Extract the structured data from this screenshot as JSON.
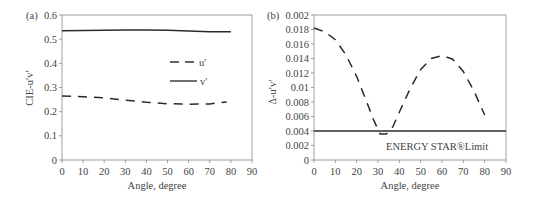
{
  "chart_data": [
    {
      "panel": "(a)",
      "type": "line",
      "title": "",
      "xlabel": "Angle, degree",
      "ylabel": "CIE-u′v′",
      "xlim": [
        0,
        90
      ],
      "ylim": [
        0,
        0.6
      ],
      "x_ticks": [
        "0",
        "10",
        "20",
        "30",
        "40",
        "50",
        "60",
        "70",
        "80",
        "90"
      ],
      "y_ticks": [
        "0",
        "0.1",
        "0.2",
        "0.3",
        "0.4",
        "0.5",
        "0.6"
      ],
      "grid": false,
      "legend_position": "inside-right",
      "series": [
        {
          "name": "u′",
          "style": "dashed",
          "x": [
            0,
            10,
            20,
            30,
            40,
            50,
            60,
            70,
            78
          ],
          "values": [
            0.265,
            0.262,
            0.257,
            0.248,
            0.239,
            0.233,
            0.231,
            0.232,
            0.24
          ]
        },
        {
          "name": "v′",
          "style": "solid",
          "x": [
            0,
            10,
            20,
            30,
            40,
            50,
            60,
            70,
            80
          ],
          "values": [
            0.535,
            0.536,
            0.537,
            0.538,
            0.538,
            0.537,
            0.534,
            0.531,
            0.531
          ]
        }
      ]
    },
    {
      "panel": "(b)",
      "type": "line",
      "title": "",
      "xlabel": "Angle, degree",
      "ylabel": "Δ-u′v′",
      "xlim": [
        0,
        90
      ],
      "ylim": [
        0,
        0.02
      ],
      "x_ticks": [
        "0",
        "10",
        "20",
        "30",
        "40",
        "50",
        "60",
        "70",
        "80",
        "90"
      ],
      "y_ticks": [
        "0",
        "0.002",
        "0.004",
        "0.006",
        "0.008",
        "0.01",
        "0.012",
        "0.014",
        "0.016",
        "0.018",
        "0.002"
      ],
      "grid": false,
      "annotations": [
        "ENERGY STAR®Limit"
      ],
      "series": [
        {
          "name": "Δu′v′",
          "style": "dashed",
          "x": [
            0,
            5,
            10,
            15,
            20,
            25,
            28,
            31,
            34,
            37,
            40,
            45,
            50,
            55,
            60,
            65,
            70,
            75,
            80
          ],
          "values": [
            0.0182,
            0.0177,
            0.0166,
            0.0145,
            0.0115,
            0.0078,
            0.0055,
            0.0036,
            0.0036,
            0.0046,
            0.0066,
            0.0098,
            0.0125,
            0.014,
            0.0144,
            0.0139,
            0.0122,
            0.0095,
            0.0062
          ]
        },
        {
          "name": "ENERGY STAR®Limit",
          "style": "solid",
          "x": [
            0,
            90
          ],
          "values": [
            0.004,
            0.004
          ]
        }
      ]
    }
  ],
  "panels": {
    "a": {
      "tag": "(a)",
      "ylabel": "CIE-u′v′",
      "xlabel": "Angle, degree",
      "legend": {
        "u": "u′",
        "v": "v′"
      }
    },
    "b": {
      "tag": "(b)",
      "ylabel": "Δ-u′v′",
      "xlabel": "Angle, degree",
      "annotation": "ENERGY STAR®Limit"
    }
  }
}
